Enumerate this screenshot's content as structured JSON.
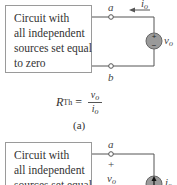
{
  "figure_a": {
    "box_lines": [
      "Circuit with",
      "all independent",
      "sources set equal",
      "to zero"
    ],
    "terminal_top": "a",
    "terminal_bottom": "b",
    "current_label": "i",
    "current_sub": "o",
    "source_label": "v",
    "source_sub": "o",
    "source_type": "voltage-source",
    "source_plus": "+",
    "source_minus": "−",
    "formula": {
      "lhs": "R",
      "lhs_sub": "Th",
      "equals": "=",
      "numerator": "v",
      "numerator_sub": "o",
      "denominator": "i",
      "denominator_sub": "o"
    },
    "caption": "(a)"
  },
  "figure_b": {
    "box_lines": [
      "Circuit with",
      "all independent",
      "sources set equal"
    ],
    "terminal_top": "a",
    "plus": "+",
    "voltage_label": "v",
    "voltage_sub": "o",
    "source_type": "current-source",
    "source_label": "i",
    "source_sub": "o"
  },
  "colors": {
    "wire": "#555555",
    "box_border": "#9a9a9a",
    "source_fill": "#9a9a9a"
  }
}
